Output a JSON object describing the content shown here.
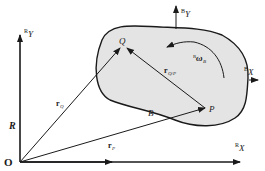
{
  "diagram": {
    "colors": {
      "line": "#1a1a1a",
      "body_fill": "#e4e4e4",
      "background": "#ffffff"
    },
    "labels": {
      "origin": "O",
      "frame": "R",
      "ground_y_super": "R",
      "ground_y": "Y",
      "ground_x_super": "R",
      "ground_x": "X",
      "body": "B",
      "point_q": "Q",
      "point_p": "P",
      "body_y_super": "B",
      "body_y": "Y",
      "body_x_super": "B",
      "body_x": "X",
      "r_q": "r",
      "r_q_sub": "Q",
      "r_p": "r",
      "r_p_sub": "P",
      "r_qp": "r",
      "r_qp_sub": "Q/P",
      "omega_super": "R",
      "omega": "ω",
      "omega_sub": "B"
    }
  }
}
